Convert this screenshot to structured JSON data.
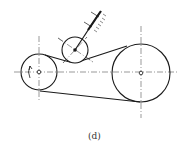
{
  "figure": {
    "caption": "(d)",
    "colors": {
      "line": "#1a1a1a",
      "centerline": "#555555"
    }
  },
  "diagram": {
    "driver_pulley": {
      "cx": 39,
      "cy": 72,
      "r": 18,
      "rotation_arrow": "counterclockwise"
    },
    "driven_pulley": {
      "cx": 141,
      "cy": 73,
      "r": 29
    },
    "tensioner_pulley": {
      "cx": 75,
      "cy": 50,
      "r": 13
    }
  }
}
